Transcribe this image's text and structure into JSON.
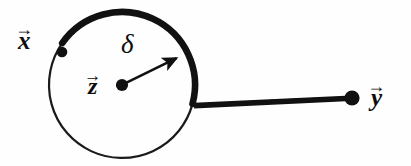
{
  "figure": {
    "background_color": "#fefefe",
    "stroke_color": "#111111"
  },
  "labels": {
    "x": {
      "symbol": "x",
      "accent": "→",
      "name": "vector-x"
    },
    "y": {
      "symbol": "y",
      "accent": "→",
      "name": "vector-y"
    },
    "z": {
      "symbol": "z",
      "accent": "→",
      "name": "vector-z"
    },
    "delta": {
      "symbol": "δ",
      "name": "radius-delta"
    }
  },
  "geometry": {
    "circle": {
      "cx": 122,
      "cy": 85,
      "r": 73,
      "thin_stroke": 2.2,
      "thick_stroke": 6.5
    },
    "arc_thick": {
      "start_angle_deg": 145,
      "end_angle_deg": 15,
      "direction": "clockwise"
    },
    "radius_arrow": {
      "from": [
        122,
        85
      ],
      "to": [
        180,
        56
      ],
      "stroke": 2.6
    },
    "segment_zy": {
      "from": [
        196,
        106
      ],
      "to": [
        350,
        98
      ],
      "stroke_start": 6.0,
      "stroke_end": 3.2
    },
    "points": [
      {
        "name": "point-x",
        "cx": 62,
        "cy": 52,
        "r": 5.2
      },
      {
        "name": "point-z",
        "cx": 122,
        "cy": 85,
        "r": 6.0
      },
      {
        "name": "point-y",
        "cx": 352,
        "cy": 98,
        "r": 7.5
      }
    ]
  }
}
